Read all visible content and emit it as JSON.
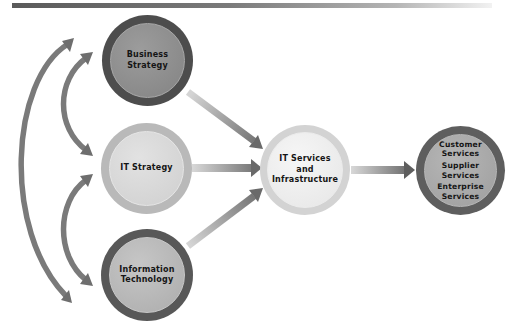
{
  "diagram": {
    "type": "flow-diagram",
    "nodes": {
      "business_strategy": {
        "lines": [
          "Business",
          "Strategy"
        ],
        "ring_color": "#4d4d4d",
        "fill_color": "#8c8c8c"
      },
      "it_strategy": {
        "lines": [
          "IT Strategy"
        ],
        "ring_color": "#b9b9b9",
        "fill_color": "#d6d6d6"
      },
      "information_technology": {
        "lines": [
          "Information",
          "Technology"
        ],
        "ring_color": "#585858",
        "fill_color": "#b4b4b4"
      },
      "it_services": {
        "lines": [
          "IT Services",
          "and",
          "Infrastructure"
        ],
        "ring_color": "#d3d3d3",
        "fill_color": "#ececec"
      },
      "services": {
        "groups": [
          [
            "Customer",
            "Services"
          ],
          [
            "Supplier",
            "Services"
          ],
          [
            "Enterprise",
            "Services"
          ]
        ],
        "ring_color": "#5e5e5e",
        "fill_color": "#a8a8a8"
      }
    },
    "edges": [
      {
        "from": "Business Strategy",
        "to": "IT Services and Infrastructure",
        "direction": "one-way"
      },
      {
        "from": "IT Strategy",
        "to": "IT Services and Infrastructure",
        "direction": "one-way"
      },
      {
        "from": "Information Technology",
        "to": "IT Services and Infrastructure",
        "direction": "one-way"
      },
      {
        "from": "IT Services and Infrastructure",
        "to": "Customer / Supplier / Enterprise Services",
        "direction": "one-way"
      },
      {
        "from": "Business Strategy",
        "to": "IT Strategy",
        "direction": "two-way"
      },
      {
        "from": "IT Strategy",
        "to": "Information Technology",
        "direction": "two-way"
      },
      {
        "from": "Business Strategy",
        "to": "Information Technology",
        "direction": "two-way"
      }
    ],
    "colors": {
      "arrow_dark": "#6e6e6e",
      "arrow_light": "#c8c8c8",
      "header_bar": "#5a5a5a"
    }
  }
}
